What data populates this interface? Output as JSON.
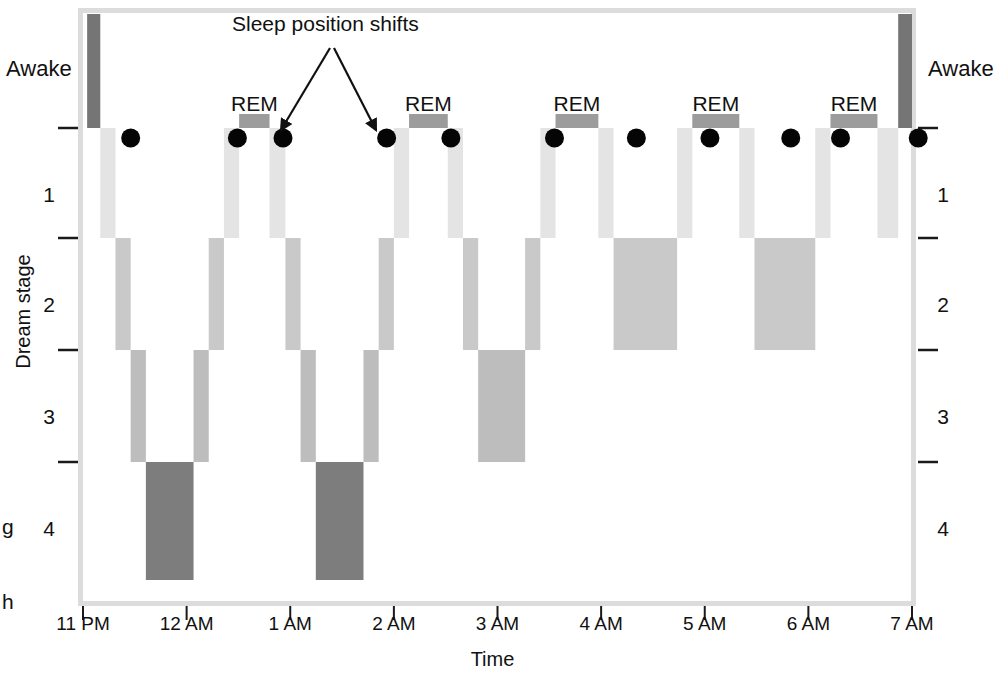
{
  "chart_data": {
    "type": "area",
    "title": "",
    "xlabel": "Time",
    "ylabel": "Dream stage",
    "x_tick_labels": [
      "11 PM",
      "12 AM",
      "1 AM",
      "2 AM",
      "3 AM",
      "4 AM",
      "5 AM",
      "6 AM",
      "7 AM"
    ],
    "x_tick_hours": [
      0,
      1,
      2,
      3,
      4,
      5,
      6,
      7,
      8
    ],
    "xlim_hours": [
      0,
      8
    ],
    "y_categories": [
      "Awake",
      "REM",
      "1",
      "2",
      "3",
      "4"
    ],
    "y_axis_left_labels": [
      "Awake",
      "1",
      "2",
      "3",
      "4"
    ],
    "y_axis_right_labels": [
      "Awake",
      "1",
      "2",
      "3",
      "4"
    ],
    "grid": false,
    "legend": "none",
    "annotations": [
      {
        "text": "Sleep position shifts",
        "points_to": [
          "shift-4",
          "shift-5"
        ]
      },
      {
        "text": "REM",
        "cycle": 2
      },
      {
        "text": "REM",
        "cycle": 3
      },
      {
        "text": "REM",
        "cycle": 4
      },
      {
        "text": "REM",
        "cycle": 5
      },
      {
        "text": "REM",
        "cycle": 6
      }
    ],
    "stage_colors": {
      "awake": "#757575",
      "rem": "#9c9c9c",
      "stage1": "#e4e4e4",
      "stage2": "#c9c9c9",
      "stage3": "#bdbdbd",
      "stage4": "#7d7d7d"
    },
    "segments": [
      {
        "stage": "awake",
        "start_hour": 0.06,
        "end_hour": 0.25,
        "label": "Awake"
      },
      {
        "stage": "stage1",
        "start_hour": 0.25,
        "end_hour": 0.47,
        "label": "1"
      },
      {
        "stage": "stage2",
        "start_hour": 0.47,
        "end_hour": 0.69,
        "label": "2"
      },
      {
        "stage": "stage3",
        "start_hour": 0.69,
        "end_hour": 0.91,
        "label": "3"
      },
      {
        "stage": "stage4",
        "start_hour": 0.91,
        "end_hour": 1.6,
        "label": "4"
      },
      {
        "stage": "stage3",
        "start_hour": 1.6,
        "end_hour": 1.82,
        "label": "3"
      },
      {
        "stage": "stage2",
        "start_hour": 1.82,
        "end_hour": 2.04,
        "label": "2"
      },
      {
        "stage": "stage1",
        "start_hour": 2.04,
        "end_hour": 2.26,
        "label": "1"
      },
      {
        "stage": "rem",
        "start_hour": 2.26,
        "end_hour": 2.7,
        "label": "REM"
      },
      {
        "stage": "stage1",
        "start_hour": 2.7,
        "end_hour": 2.93,
        "label": "1"
      },
      {
        "stage": "stage2",
        "start_hour": 2.93,
        "end_hour": 3.15,
        "label": "2"
      },
      {
        "stage": "stage3",
        "start_hour": 3.15,
        "end_hour": 3.37,
        "label": "3"
      },
      {
        "stage": "stage4",
        "start_hour": 3.37,
        "end_hour": 4.06,
        "label": "4"
      },
      {
        "stage": "stage3",
        "start_hour": 4.06,
        "end_hour": 4.28,
        "label": "3"
      },
      {
        "stage": "stage2",
        "start_hour": 4.28,
        "end_hour": 4.5,
        "label": "2"
      },
      {
        "stage": "stage1",
        "start_hour": 4.5,
        "end_hour": 4.72,
        "label": "1"
      },
      {
        "stage": "rem",
        "start_hour": 4.72,
        "end_hour": 5.28,
        "label": "REM"
      },
      {
        "stage": "stage1",
        "start_hour": 5.28,
        "end_hour": 5.5,
        "label": "1"
      },
      {
        "stage": "stage2",
        "start_hour": 5.5,
        "end_hour": 5.72,
        "label": "2"
      },
      {
        "stage": "stage3",
        "start_hour": 5.72,
        "end_hour": 6.4,
        "label": "3"
      },
      {
        "stage": "stage2",
        "start_hour": 6.4,
        "end_hour": 6.62,
        "label": "2"
      },
      {
        "stage": "stage1",
        "start_hour": 6.62,
        "end_hour": 6.84,
        "label": "1"
      },
      {
        "stage": "rem",
        "start_hour": 6.84,
        "end_hour": 7.46,
        "label": "REM"
      },
      {
        "stage": "stage1",
        "start_hour": 7.46,
        "end_hour": 7.68,
        "label": "1"
      },
      {
        "stage": "stage2",
        "start_hour": 7.68,
        "end_hour": 8.6,
        "label": "2"
      },
      {
        "stage": "stage1",
        "start_hour": 8.6,
        "end_hour": 8.82,
        "label": "1"
      },
      {
        "stage": "rem",
        "start_hour": 8.82,
        "end_hour": 9.5,
        "label": "REM"
      },
      {
        "stage": "stage1",
        "start_hour": 9.5,
        "end_hour": 9.72,
        "label": "1"
      },
      {
        "stage": "stage2",
        "start_hour": 9.72,
        "end_hour": 10.6,
        "label": "2"
      },
      {
        "stage": "stage1",
        "start_hour": 10.6,
        "end_hour": 10.82,
        "label": "1"
      },
      {
        "stage": "rem",
        "start_hour": 10.82,
        "end_hour": 11.5,
        "label": "REM"
      },
      {
        "stage": "stage1",
        "start_hour": 11.5,
        "end_hour": 11.8,
        "label": "1"
      },
      {
        "stage": "awake",
        "start_hour": 11.8,
        "end_hour": 12.0,
        "label": "Awake"
      }
    ],
    "position_shift_count": 11,
    "position_shift_hours": [
      0.46,
      1.49,
      1.93,
      2.93,
      3.55,
      4.55,
      5.34,
      6.05,
      6.83,
      7.31,
      8.06
    ]
  },
  "axis": {
    "y_left": {
      "awake": "Awake",
      "ticks": [
        "1",
        "2",
        "3",
        "4"
      ]
    },
    "y_right": {
      "awake": "Awake",
      "ticks": [
        "1",
        "2",
        "3",
        "4"
      ]
    },
    "y_title": "Dream stage",
    "x_title": "Time",
    "x_ticks": [
      "11 PM",
      "12 AM",
      "1 AM",
      "2 AM",
      "3 AM",
      "4 AM",
      "5 AM",
      "6 AM",
      "7 AM"
    ]
  },
  "annotations": {
    "shift_label": "Sleep position shifts",
    "rem_labels": [
      "REM",
      "REM",
      "REM",
      "REM",
      "REM"
    ]
  },
  "stray": {
    "g": "g",
    "h": "h"
  }
}
